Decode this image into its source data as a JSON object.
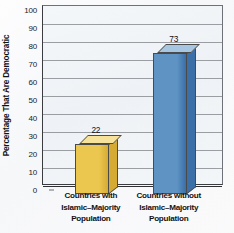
{
  "chart_data": {
    "type": "bar",
    "title": "",
    "subtitle": "",
    "xlabel": "",
    "ylabel": "Percentage That Are Democratic",
    "categories": [
      "Countries with Islamic–Majority Population",
      "Countries without Islamic–Majority Population"
    ],
    "category_lines": [
      [
        "Countries with",
        "Islamic–Majority",
        "Population"
      ],
      [
        "Countries without",
        "Islamic–Majority",
        "Population"
      ]
    ],
    "values": [
      22,
      73
    ],
    "value_labels": [
      "22",
      "73"
    ],
    "ylim": [
      0,
      100
    ],
    "yticks": [
      0,
      10,
      20,
      30,
      40,
      50,
      60,
      70,
      80,
      90,
      100
    ],
    "ytick_labels": [
      "0",
      "10",
      "20",
      "30",
      "40",
      "50",
      "60",
      "70",
      "80",
      "90",
      "100"
    ],
    "grid": true,
    "legend": false,
    "legend_position": "none",
    "bar_colors": [
      "#ecc74f",
      "#5e93c4"
    ],
    "bar_side_colors": [
      "#d6ab34",
      "#3a6fa8"
    ],
    "bar_top_colors": [
      "#f6e29a",
      "#a7c6e2"
    ],
    "plot_background": "#f1f5f8",
    "gridline_color": "#8b8e93",
    "axis_color": "#2e3033",
    "text_color": "#111114"
  }
}
